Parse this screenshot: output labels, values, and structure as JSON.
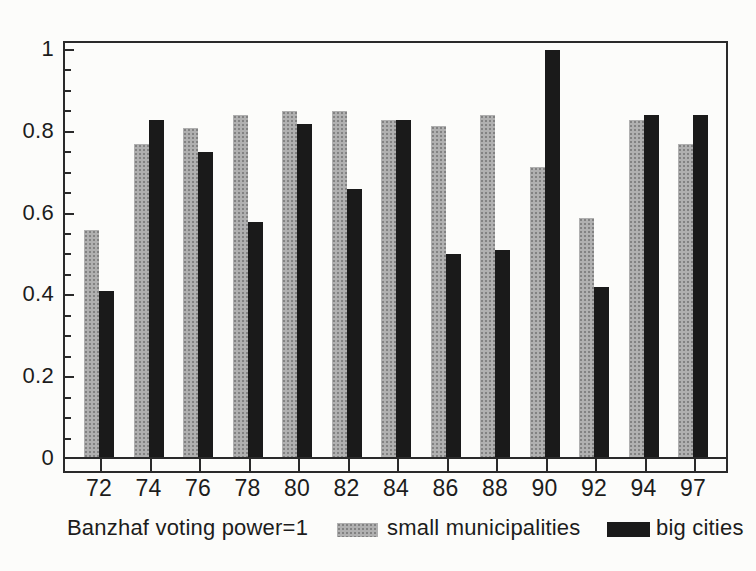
{
  "chart_data": {
    "type": "bar",
    "title": "",
    "xlabel": "",
    "ylabel": "",
    "categories": [
      "72",
      "74",
      "76",
      "78",
      "80",
      "82",
      "84",
      "86",
      "88",
      "90",
      "92",
      "94",
      "97"
    ],
    "series": [
      {
        "name": "small municipalities",
        "color": "#a3a3a3",
        "values": [
          0.56,
          0.77,
          0.81,
          0.84,
          0.85,
          0.85,
          0.83,
          0.815,
          0.84,
          0.715,
          0.59,
          0.83,
          0.77
        ]
      },
      {
        "name": "big cities",
        "color": "#1a1a1a",
        "values": [
          0.41,
          0.83,
          0.75,
          0.58,
          0.82,
          0.66,
          0.83,
          0.5,
          0.51,
          1.0,
          0.42,
          0.84,
          0.84
        ]
      }
    ],
    "ylim": [
      0,
      1.02
    ],
    "yticks": [
      {
        "value": 0,
        "label": "0"
      },
      {
        "value": 0.2,
        "label": "0.2"
      },
      {
        "value": 0.4,
        "label": "0.4"
      },
      {
        "value": 0.6,
        "label": "0.6"
      },
      {
        "value": 0.8,
        "label": "0.8"
      },
      {
        "value": 1,
        "label": "1"
      }
    ],
    "minor_tick_step": 0.05,
    "grid": false,
    "legend_position": "bottom",
    "annotation": "Banzhaf voting power=1"
  }
}
